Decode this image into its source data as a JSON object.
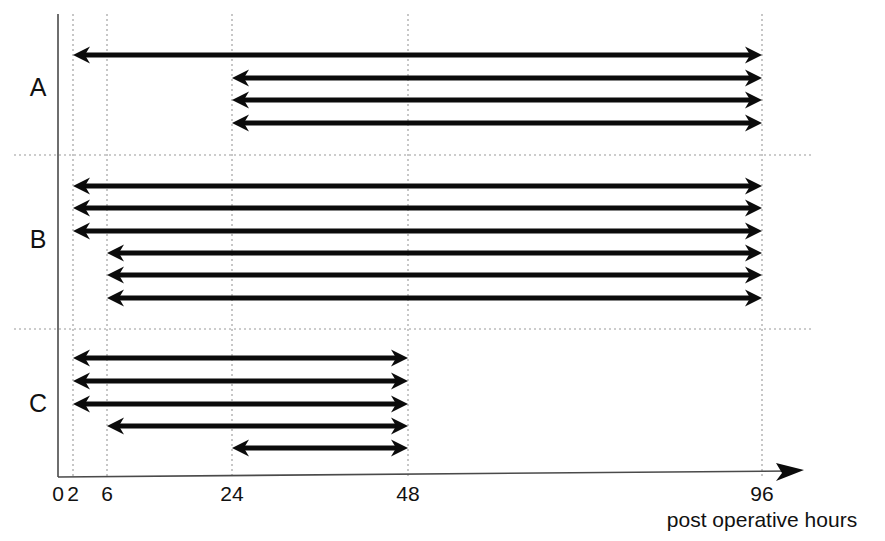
{
  "chart_data": {
    "type": "bar",
    "title": "",
    "subtitle": "",
    "xlabel": "post operative hours",
    "ylabel": "",
    "xlim": [
      0,
      104
    ],
    "ylim": [
      0,
      15
    ],
    "grid": true,
    "legend": null,
    "orientation": "horizontal",
    "note": "Horizontal double-headed arrows (interval ranges) grouped into three categories A, B and C along a post-operative-hours time axis.",
    "axis": {
      "ticks": [
        {
          "value": 0,
          "label": "0",
          "gridline": false
        },
        {
          "value": 2,
          "label": "2",
          "gridline": true
        },
        {
          "value": 6,
          "label": "6",
          "gridline": true
        },
        {
          "value": 24,
          "label": "24",
          "gridline": true
        },
        {
          "value": 48,
          "label": "48",
          "gridline": true
        },
        {
          "value": 96,
          "label": "96",
          "gridline": true
        }
      ]
    },
    "groups": [
      {
        "label": "A",
        "count": 4,
        "intervals": [
          {
            "start": 2,
            "end": 96
          },
          {
            "start": 24,
            "end": 96
          },
          {
            "start": 24,
            "end": 96
          },
          {
            "start": 24,
            "end": 96
          }
        ]
      },
      {
        "label": "B",
        "count": 6,
        "intervals": [
          {
            "start": 2,
            "end": 96
          },
          {
            "start": 2,
            "end": 96
          },
          {
            "start": 2,
            "end": 96
          },
          {
            "start": 6,
            "end": 96
          },
          {
            "start": 6,
            "end": 96
          },
          {
            "start": 6,
            "end": 96
          }
        ]
      },
      {
        "label": "C",
        "count": 5,
        "intervals": [
          {
            "start": 2,
            "end": 48
          },
          {
            "start": 2,
            "end": 48
          },
          {
            "start": 2,
            "end": 48
          },
          {
            "start": 6,
            "end": 48
          },
          {
            "start": 24,
            "end": 48
          }
        ]
      }
    ],
    "colors": {
      "arrow": "#0b0b0b",
      "grid": "#9a9a9a",
      "axis": "#4a4a4a",
      "text": "#111111",
      "background": "#ffffff"
    }
  },
  "geometry": {
    "plot_left": 58,
    "plot_right": 800,
    "plot_top": 14,
    "baseline_y": 477,
    "tick_label_y": 501,
    "axis_title_y": 527,
    "axis_title_x": 762,
    "arrow_head_len": 17,
    "arrow_head_half": 8.5,
    "x_scale": [
      {
        "value": 0,
        "px": 58
      },
      {
        "value": 2,
        "px": 73
      },
      {
        "value": 6,
        "px": 107
      },
      {
        "value": 24,
        "px": 232
      },
      {
        "value": 48,
        "px": 408
      },
      {
        "value": 96,
        "px": 762
      }
    ],
    "separators": [
      {
        "y": 155,
        "x1": 14,
        "x2": 812
      },
      {
        "y": 329,
        "x1": 14,
        "x2": 812
      }
    ],
    "group_label_x": 38,
    "group_label_y": [
      96,
      248,
      412
    ],
    "rows_y": {
      "A": [
        55,
        78,
        100,
        123
      ],
      "B": [
        186,
        208,
        231,
        253,
        275,
        298
      ],
      "C": [
        358,
        381,
        404,
        426,
        448
      ]
    },
    "gridline_top": 14,
    "gridline_bottom": 477,
    "axis_arrow_x": 790
  }
}
